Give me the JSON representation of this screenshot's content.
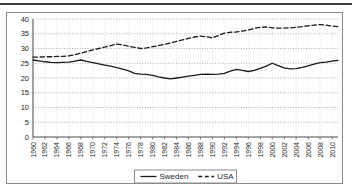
{
  "chart_data": {
    "type": "line",
    "title": "",
    "subtitle": "",
    "xlabel": "",
    "ylabel": "",
    "xlim": [
      1960,
      2011
    ],
    "ylim": [
      0,
      40
    ],
    "ytick_labels": [
      "0",
      "5",
      "10",
      "15",
      "20",
      "25",
      "30",
      "35",
      "40"
    ],
    "ytick_values": [
      0,
      5,
      10,
      15,
      20,
      25,
      30,
      35,
      40
    ],
    "xtick_labels": [
      "1960",
      "1962",
      "1964",
      "1966",
      "1968",
      "1970",
      "1972",
      "1974",
      "1976",
      "1978",
      "1980",
      "1982",
      "1984",
      "1986",
      "1988",
      "1990",
      "1992",
      "1994",
      "1996",
      "1998",
      "2000",
      "2002",
      "2004",
      "2006",
      "2008",
      "2010"
    ],
    "xtick_values": [
      1960,
      1962,
      1964,
      1966,
      1968,
      1970,
      1972,
      1974,
      1976,
      1978,
      1980,
      1982,
      1984,
      1986,
      1988,
      1990,
      1992,
      1994,
      1996,
      1998,
      2000,
      2002,
      2004,
      2006,
      2008,
      2010
    ],
    "grid": true,
    "grid_style": "dotted-horizontal",
    "legend_position": "bottom",
    "x": [
      1960,
      1961,
      1962,
      1963,
      1964,
      1965,
      1966,
      1967,
      1968,
      1969,
      1970,
      1971,
      1972,
      1973,
      1974,
      1975,
      1976,
      1977,
      1978,
      1979,
      1980,
      1981,
      1982,
      1983,
      1984,
      1985,
      1986,
      1987,
      1988,
      1989,
      1990,
      1991,
      1992,
      1993,
      1994,
      1995,
      1996,
      1997,
      1998,
      1999,
      2000,
      2001,
      2002,
      2003,
      2004,
      2005,
      2006,
      2007,
      2008,
      2009,
      2010,
      2011
    ],
    "series": [
      {
        "name": "Sweden",
        "line_style": "solid",
        "color": "#1a1a1a",
        "values": [
          26.1,
          25.8,
          25.5,
          25.3,
          25.2,
          25.3,
          25.4,
          25.7,
          26.1,
          25.6,
          25.2,
          24.8,
          24.4,
          24.0,
          23.5,
          23.0,
          22.4,
          21.6,
          21.3,
          21.2,
          20.9,
          20.4,
          20.0,
          19.7,
          20.0,
          20.3,
          20.6,
          20.9,
          21.2,
          21.3,
          21.2,
          21.3,
          21.6,
          22.3,
          22.9,
          22.6,
          22.2,
          22.6,
          23.3,
          24.0,
          25.0,
          24.2,
          23.4,
          23.1,
          23.2,
          23.6,
          24.1,
          24.7,
          25.2,
          25.4,
          25.7,
          26.0
        ]
      },
      {
        "name": "USA",
        "line_style": "dashed",
        "color": "#1a1a1a",
        "values": [
          27.1,
          27.1,
          27.2,
          27.2,
          27.3,
          27.3,
          27.5,
          27.9,
          28.4,
          29.0,
          29.5,
          30.0,
          30.5,
          31.0,
          31.5,
          31.2,
          30.8,
          30.4,
          30.0,
          30.2,
          30.6,
          31.0,
          31.4,
          31.9,
          32.4,
          32.9,
          33.4,
          33.9,
          34.2,
          34.0,
          33.6,
          34.4,
          35.2,
          35.5,
          35.6,
          35.9,
          36.3,
          36.8,
          37.2,
          37.3,
          37.0,
          36.9,
          36.9,
          37.0,
          37.2,
          37.4,
          37.7,
          37.9,
          38.1,
          37.9,
          37.6,
          37.4
        ]
      }
    ]
  },
  "legend": {
    "items": [
      {
        "label": "Sweden",
        "style": "solid"
      },
      {
        "label": "USA",
        "style": "dashed"
      }
    ]
  }
}
